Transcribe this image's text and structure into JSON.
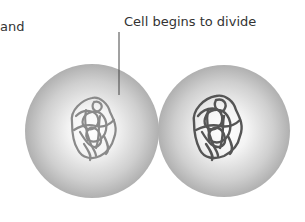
{
  "labels": {
    "partial_left": "and",
    "cell_divide": "Cell begins to divide"
  },
  "colors": {
    "cell_rim": "#a8a8a8",
    "cell_center": "#ffffff",
    "chromatin_left": "#8a8a8a",
    "chromatin_right": "#555555",
    "leader_line": "#444444",
    "text": "#333333"
  },
  "cells": [
    {
      "name": "left-cell",
      "chromatin_shade": "light"
    },
    {
      "name": "right-cell",
      "chromatin_shade": "dark"
    }
  ]
}
